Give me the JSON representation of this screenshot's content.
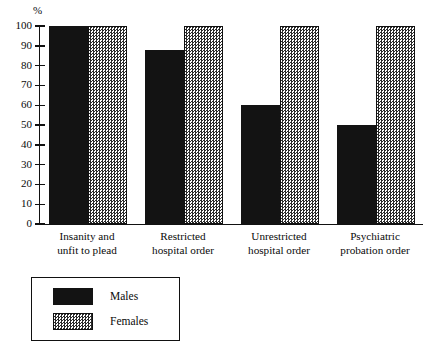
{
  "chart_data": {
    "type": "bar",
    "title": "",
    "xlabel": "",
    "ylabel": "%",
    "ylim": [
      0,
      100
    ],
    "grid": false,
    "legend_position": "bottom-left",
    "categories": [
      "Insanity and unfit to plead",
      "Restricted hospital order",
      "Unrestricted hospital order",
      "Psychiatric probation order"
    ],
    "category_lines": [
      [
        "Insanity and",
        "unfit to plead"
      ],
      [
        "Restricted",
        "hospital order"
      ],
      [
        "Unrestricted",
        "hospital order"
      ],
      [
        "Psychiatric",
        "probation order"
      ]
    ],
    "series": [
      {
        "name": "Males",
        "values": [
          100,
          88,
          60,
          50
        ],
        "color": "#131313",
        "pattern": "solid"
      },
      {
        "name": "Females",
        "values": [
          100,
          100,
          100,
          100
        ],
        "color": "#2a2a2a",
        "pattern": "stipple"
      }
    ],
    "yticks": [
      0,
      10,
      20,
      30,
      40,
      50,
      60,
      70,
      80,
      90,
      100
    ],
    "ytick_labels": [
      "0",
      "10",
      "20",
      "30",
      "40",
      "50",
      "60",
      "70",
      "80",
      "90",
      "100"
    ]
  },
  "axis": {
    "unit_label": "%"
  },
  "legend": {
    "entries": [
      {
        "label": "Males"
      },
      {
        "label": "Females"
      }
    ]
  }
}
